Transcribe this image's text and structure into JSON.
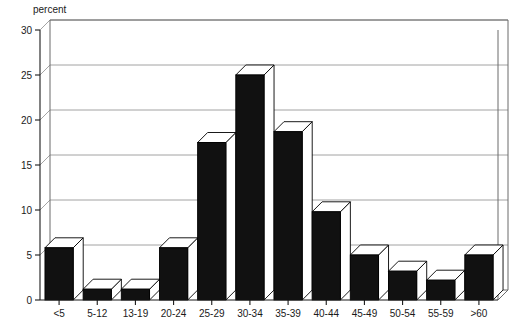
{
  "chart_data": {
    "type": "bar",
    "title": "",
    "subtitle": "",
    "xlabel": "",
    "ylabel": "percent",
    "ylim": [
      0,
      30
    ],
    "yticks": [
      0,
      5,
      10,
      15,
      20,
      25,
      30
    ],
    "ytick_labels": [
      "0",
      "5",
      "10",
      "15",
      "20",
      "25",
      "30"
    ],
    "grid": true,
    "legend": "none",
    "style": "3d-bars",
    "categories": [
      "<5",
      "5-12",
      "13-19",
      "20-24",
      "25-29",
      "30-34",
      "35-39",
      "40-44",
      "45-49",
      "50-54",
      "55-59",
      ">60"
    ],
    "values": [
      5.8,
      1.2,
      1.2,
      5.8,
      17.5,
      25.0,
      18.7,
      9.8,
      5.0,
      3.2,
      2.2,
      5.0
    ],
    "colors": {
      "bar_front": "#111111",
      "bar_top": "#ffffff",
      "bar_side": "#ffffff",
      "gridline": "#8c8c8c",
      "axis": "#1a1a1a",
      "background": "#ffffff"
    }
  },
  "axis": {
    "y_label": "percent"
  }
}
